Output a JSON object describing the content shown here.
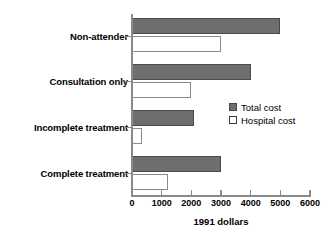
{
  "chart_data": {
    "type": "bar",
    "orientation": "horizontal",
    "title": "",
    "xlabel": "1991 dollars",
    "ylabel": "",
    "xlim": [
      0,
      6000
    ],
    "xticks": [
      0,
      1000,
      2000,
      3000,
      4000,
      5000,
      6000
    ],
    "xtick_labels": [
      "0",
      "1000",
      "2000",
      "3000",
      "4000",
      "5000",
      "6000"
    ],
    "grid": false,
    "legend_position": "center-right",
    "categories": [
      "Non-attender",
      "Consultation only",
      "Incomplete treatment",
      "Complete treatment"
    ],
    "series": [
      {
        "name": "Total cost",
        "color": "#6e6e6e",
        "values": [
          5000,
          4000,
          2100,
          3000
        ]
      },
      {
        "name": "Hospital cost",
        "color": "#ffffff",
        "values": [
          3000,
          2000,
          350,
          1200
        ]
      }
    ]
  },
  "legend": {
    "items": [
      {
        "label": "Total cost",
        "swatch": "filled-gray-swatch"
      },
      {
        "label": "Hospital cost",
        "swatch": "outlined-white-swatch"
      }
    ]
  }
}
